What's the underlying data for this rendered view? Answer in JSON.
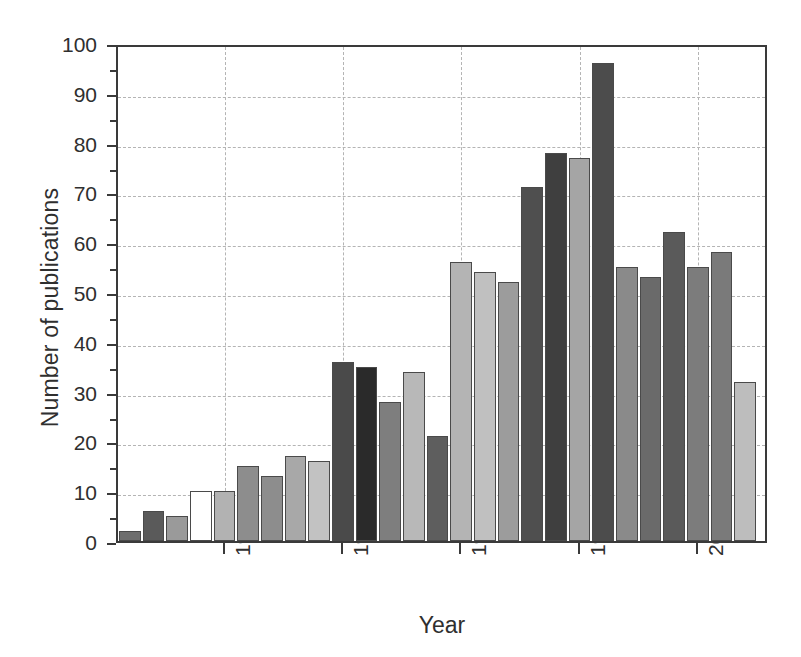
{
  "chart_data": {
    "type": "bar",
    "title": "",
    "xlabel": "Year",
    "ylabel": "Number of publications",
    "xlim": [
      1975.5,
      2003.0
    ],
    "ylim": [
      0,
      100
    ],
    "grid": true,
    "legend": "none",
    "y_major_ticks": [
      0,
      10,
      20,
      30,
      40,
      50,
      60,
      70,
      80,
      90,
      100
    ],
    "y_minor_ticks": [
      5,
      15,
      25,
      35,
      45,
      55,
      65,
      75,
      85,
      95
    ],
    "y_tick_labels": [
      "0",
      "10",
      "20",
      "30",
      "40",
      "50",
      "60",
      "70",
      "80",
      "90",
      "100"
    ],
    "x_major_ticks": [
      1980,
      1985,
      1990,
      1995,
      2000
    ],
    "x_tick_labels": [
      "1980",
      "1985",
      "1990",
      "1995",
      "2000"
    ],
    "categories": [
      1976,
      1977,
      1978,
      1979,
      1980,
      1981,
      1982,
      1983,
      1984,
      1985,
      1986,
      1987,
      1988,
      1989,
      1990,
      1991,
      1992,
      1993,
      1994,
      1995,
      1996,
      1997,
      1998,
      1999,
      2000,
      2001,
      2002
    ],
    "values": [
      2,
      6,
      5,
      10,
      10,
      15,
      13,
      17,
      16,
      36,
      35,
      28,
      34,
      21,
      56,
      54,
      52,
      71,
      78,
      77,
      96,
      55,
      53,
      62,
      55,
      58,
      32
    ],
    "bar_colors": [
      "#6e6e6e",
      "#5a5a5a",
      "#9a9a9a",
      "#ffffff",
      "#b2b2b2",
      "#8d8d8d",
      "#8d8d8d",
      "#a8a8a8",
      "#c2c2c2",
      "#4a4a4a",
      "#2a2a2a",
      "#7e7e7e",
      "#b8b8b8",
      "#5e5e5e",
      "#b4b4b4",
      "#c0c0c0",
      "#9c9c9c",
      "#4f4f4f",
      "#3f3f3f",
      "#a5a5a5",
      "#4c4c4c",
      "#8a8a8a",
      "#6a6a6a",
      "#5a5a5a",
      "#7c7c7c",
      "#7a7a7a",
      "#bdbdbd"
    ]
  }
}
